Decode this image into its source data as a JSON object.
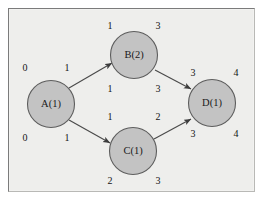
{
  "diagram": {
    "type": "directed-graph",
    "background_color": "#eeeeec",
    "node_fill_color": "#c3c3c3",
    "node_stroke_color": "#5d5d5d",
    "edge_color": "#4a4a4a",
    "frame_color": "#7b7b7b",
    "nodes": [
      {
        "id": "A",
        "label": "A(1)",
        "cx": 51,
        "cy": 104,
        "r": 24,
        "annotations": {
          "top_left": "0",
          "top_right": "1",
          "bottom_left": "0",
          "bottom_right": "1"
        }
      },
      {
        "id": "B",
        "label": "B(2)",
        "cx": 134,
        "cy": 55,
        "r": 24,
        "annotations": {
          "top_left": "1",
          "top_right": "3",
          "bottom_left": "1",
          "bottom_right": "3"
        }
      },
      {
        "id": "C",
        "label": "C(1)",
        "cx": 133,
        "cy": 151,
        "r": 24,
        "annotations": {
          "top_left": "1",
          "top_right": "2",
          "bottom_left": "2",
          "bottom_right": "3"
        }
      },
      {
        "id": "D",
        "label": "D(1)",
        "cx": 212,
        "cy": 103,
        "r": 24,
        "annotations": {
          "top_left": "3",
          "top_right": "4",
          "bottom_left": "3",
          "bottom_right": "4"
        }
      }
    ],
    "edges": [
      {
        "id": "A-B",
        "from": "A",
        "to": "B"
      },
      {
        "id": "A-C",
        "from": "A",
        "to": "C"
      },
      {
        "id": "B-D",
        "from": "B",
        "to": "D"
      },
      {
        "id": "C-D",
        "from": "C",
        "to": "D"
      }
    ],
    "number_labels": [
      {
        "id": "a-tl",
        "text": "0",
        "x": 25,
        "y": 69
      },
      {
        "id": "a-tr",
        "text": "1",
        "x": 67,
        "y": 69
      },
      {
        "id": "a-bl",
        "text": "0",
        "x": 25,
        "y": 139
      },
      {
        "id": "a-br",
        "text": "1",
        "x": 67,
        "y": 139
      },
      {
        "id": "b-tl",
        "text": "1",
        "x": 110,
        "y": 27
      },
      {
        "id": "b-tr",
        "text": "3",
        "x": 158,
        "y": 27
      },
      {
        "id": "b-bl",
        "text": "1",
        "x": 110,
        "y": 90
      },
      {
        "id": "b-br",
        "text": "3",
        "x": 158,
        "y": 90
      },
      {
        "id": "c-tl",
        "text": "1",
        "x": 110,
        "y": 118
      },
      {
        "id": "c-tr",
        "text": "2",
        "x": 158,
        "y": 118
      },
      {
        "id": "c-bl",
        "text": "2",
        "x": 110,
        "y": 182
      },
      {
        "id": "c-br",
        "text": "3",
        "x": 158,
        "y": 182
      },
      {
        "id": "d-tl",
        "text": "3",
        "x": 193,
        "y": 74
      },
      {
        "id": "d-tr",
        "text": "4",
        "x": 236,
        "y": 74
      },
      {
        "id": "d-bl",
        "text": "3",
        "x": 193,
        "y": 135
      },
      {
        "id": "d-br",
        "text": "4",
        "x": 236,
        "y": 135
      }
    ]
  }
}
